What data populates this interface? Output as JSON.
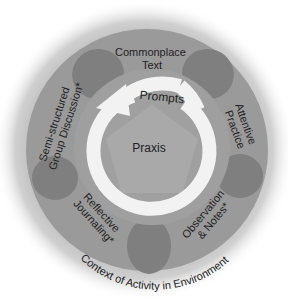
{
  "center": {
    "label": "Praxis"
  },
  "arrow": {
    "label": "Prompts"
  },
  "segments": [
    {
      "id": "commonplace",
      "lines": [
        "Commonplace",
        "Text"
      ]
    },
    {
      "id": "attentive",
      "lines": [
        "Attentive",
        "Practice"
      ]
    },
    {
      "id": "observation",
      "lines": [
        "Observation",
        "& Notes*"
      ]
    },
    {
      "id": "reflective",
      "lines": [
        "Reflective",
        "Journaling*"
      ]
    },
    {
      "id": "semistructured",
      "lines": [
        "Semi-structured",
        "Group Discussion*"
      ]
    }
  ],
  "context": {
    "label": "Context of Activity in Environment"
  },
  "colors": {
    "halo": "#bdbdbd",
    "ring": "#9a9a9a",
    "petal": "#7f7f7f",
    "center": "#a6a6a6",
    "arrow": "#f2f2f2",
    "text": "#222222"
  }
}
